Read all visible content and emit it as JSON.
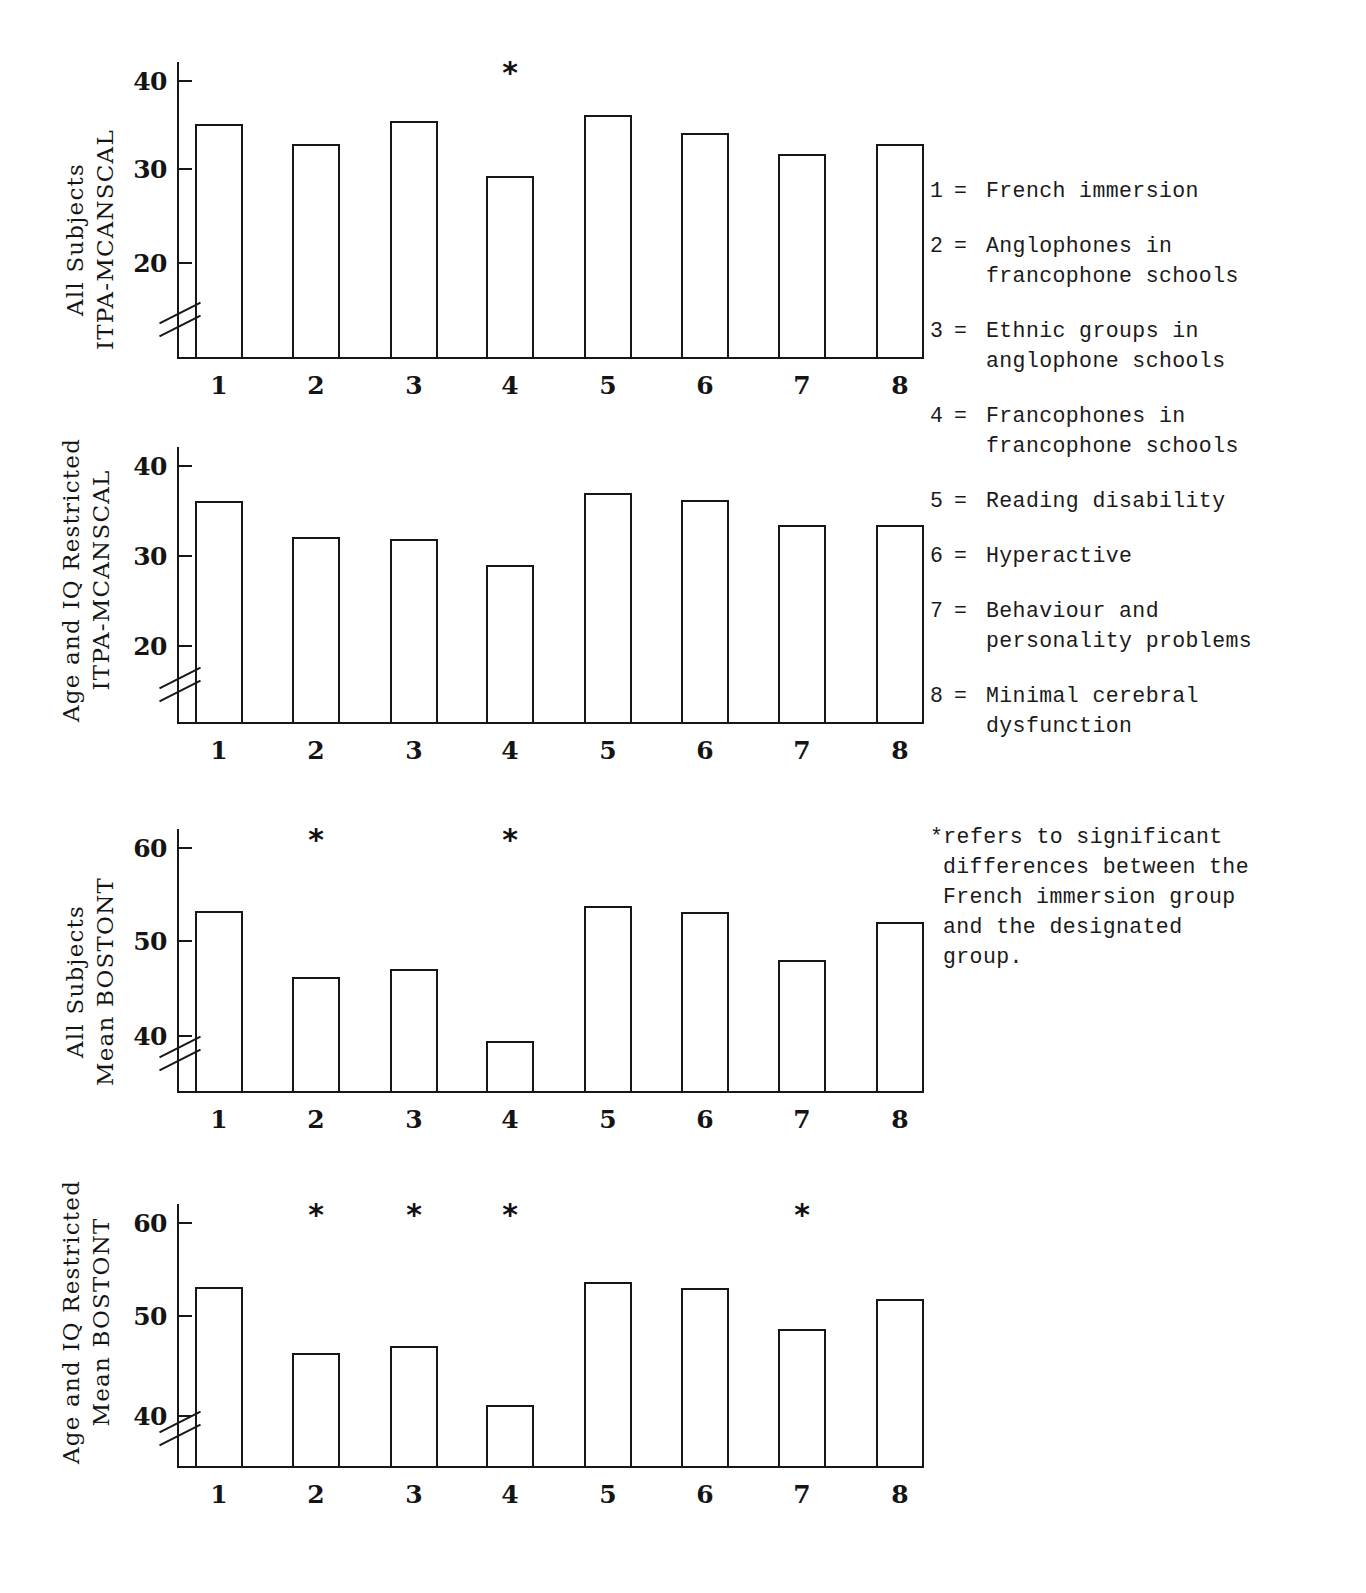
{
  "chart_data": [
    {
      "type": "bar",
      "panel_id": "panel-1",
      "title": "",
      "ylabel_lines": [
        "All Subjects",
        "ITPA-MCANSCAL"
      ],
      "xlabel": "",
      "categories": [
        "1",
        "2",
        "3",
        "4",
        "5",
        "6",
        "7",
        "8"
      ],
      "values": [
        35.2,
        33.0,
        35.5,
        29.4,
        36.2,
        34.2,
        31.9,
        33.0
      ],
      "yticks": [
        20,
        30,
        40
      ],
      "ytick_labels": [
        "20",
        "30",
        "40"
      ],
      "ylim": [
        14,
        42
      ],
      "axis_break": true,
      "grid": false,
      "significance_markers": [
        "",
        "",
        "",
        "*",
        "",
        "",
        "",
        ""
      ]
    },
    {
      "type": "bar",
      "panel_id": "panel-2",
      "title": "",
      "ylabel_lines": [
        "Age and IQ Restricted",
        "ITPA-MCANSCAL"
      ],
      "xlabel": "",
      "categories": [
        "1",
        "2",
        "3",
        "4",
        "5",
        "6",
        "7",
        "8"
      ],
      "values": [
        36.0,
        32.0,
        31.8,
        28.9,
        36.9,
        36.1,
        33.3,
        33.3
      ],
      "yticks": [
        20,
        30,
        40
      ],
      "ytick_labels": [
        "20",
        "30",
        "40"
      ],
      "ylim": [
        14,
        42
      ],
      "axis_break": true,
      "grid": false,
      "significance_markers": [
        "",
        "",
        "",
        "",
        "",
        "",
        "",
        ""
      ]
    },
    {
      "type": "bar",
      "panel_id": "panel-3",
      "title": "",
      "ylabel_lines": [
        "All Subjects",
        "Mean BOSTONT"
      ],
      "xlabel": "",
      "categories": [
        "1",
        "2",
        "3",
        "4",
        "5",
        "6",
        "7",
        "8"
      ],
      "values": [
        53.2,
        46.2,
        47.0,
        39.4,
        53.7,
        53.1,
        48.0,
        52.0
      ],
      "yticks": [
        40,
        50,
        60
      ],
      "ytick_labels": [
        "40",
        "50",
        "60"
      ],
      "ylim": [
        33,
        62
      ],
      "axis_break": true,
      "grid": false,
      "significance_markers": [
        "",
        "*",
        "",
        "*",
        "",
        "",
        "",
        ""
      ]
    },
    {
      "type": "bar",
      "panel_id": "panel-4",
      "title": "",
      "ylabel_lines": [
        "Age and IQ Restricted",
        "Mean BOSTONT"
      ],
      "xlabel": "",
      "categories": [
        "1",
        "2",
        "3",
        "4",
        "5",
        "6",
        "7",
        "8"
      ],
      "values": [
        53.3,
        46.4,
        47.1,
        41.0,
        53.8,
        53.2,
        48.9,
        52.0
      ],
      "yticks": [
        40,
        50,
        60
      ],
      "ytick_labels": [
        "40",
        "50",
        "60"
      ],
      "ylim": [
        33,
        62
      ],
      "axis_break": true,
      "grid": false,
      "significance_markers": [
        "",
        "*",
        "*",
        "*",
        "",
        "",
        "*",
        ""
      ]
    }
  ],
  "legend": {
    "items": [
      {
        "key": "1",
        "eq": "=",
        "lines": [
          "French immersion"
        ]
      },
      {
        "key": "2",
        "eq": "=",
        "lines": [
          "Anglophones in",
          "francophone schools"
        ]
      },
      {
        "key": "3",
        "eq": "=",
        "lines": [
          "Ethnic groups in",
          "anglophone schools"
        ]
      },
      {
        "key": "4",
        "eq": "=",
        "lines": [
          "Francophones in",
          "francophone schools"
        ]
      },
      {
        "key": "5",
        "eq": "=",
        "lines": [
          "Reading disability"
        ]
      },
      {
        "key": "6",
        "eq": "=",
        "lines": [
          "Hyperactive"
        ]
      },
      {
        "key": "7",
        "eq": "=",
        "lines": [
          "Behaviour and",
          "personality problems"
        ]
      },
      {
        "key": "8",
        "eq": "=",
        "lines": [
          "Minimal cerebral",
          "dysfunction"
        ]
      }
    ]
  },
  "footnote": {
    "lines": [
      "*refers to significant",
      "differences between the",
      "French immersion group",
      "and the designated",
      "group."
    ]
  },
  "colors": {
    "ink": "#171717",
    "paper": "#ffffff"
  }
}
